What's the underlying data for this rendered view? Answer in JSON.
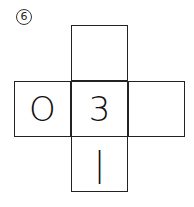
{
  "problem_number": "6",
  "net": {
    "top": "",
    "left": "O",
    "center": "3",
    "right": "",
    "bottom": "|"
  }
}
